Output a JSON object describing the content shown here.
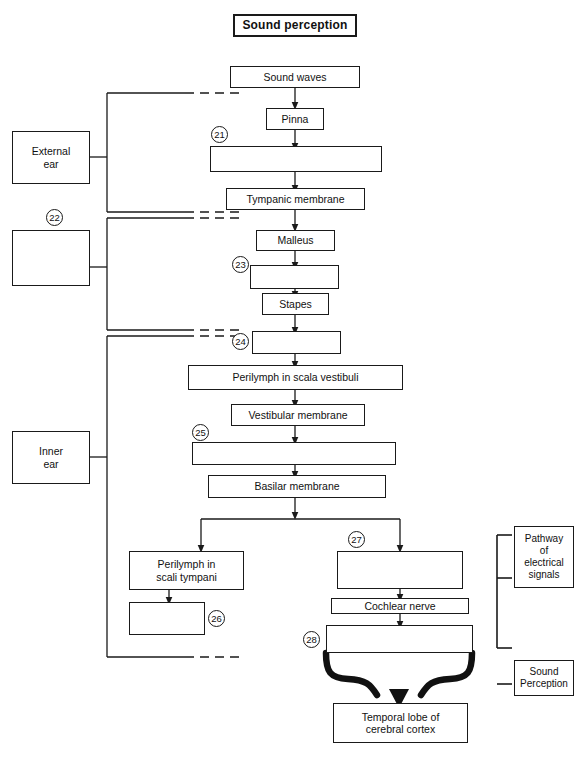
{
  "title": {
    "label": "Sound perception"
  },
  "side_labels": [
    {
      "id": "external-ear",
      "label": "External\near",
      "lines": [
        "External",
        "ear"
      ]
    },
    {
      "id": "middle-ear-blank",
      "label": "",
      "lines": []
    },
    {
      "id": "inner-ear",
      "label": "Inner\near",
      "lines": [
        "Inner",
        "ear"
      ]
    }
  ],
  "right_labels": [
    {
      "id": "pathway-of-electrical-signals",
      "lines": [
        "Pathway",
        "of",
        "electrical",
        "signals"
      ]
    },
    {
      "id": "sound-perception",
      "lines": [
        "Sound",
        "Perception"
      ]
    }
  ],
  "flow_boxes": [
    {
      "id": "sound-waves",
      "label": "Sound waves"
    },
    {
      "id": "pinna",
      "label": "Pinna"
    },
    {
      "id": "blank-21",
      "label": ""
    },
    {
      "id": "tympanic-membrane",
      "label": "Tympanic membrane"
    },
    {
      "id": "malleus",
      "label": "Malleus"
    },
    {
      "id": "blank-23",
      "label": ""
    },
    {
      "id": "stapes",
      "label": "Stapes"
    },
    {
      "id": "blank-24",
      "label": ""
    },
    {
      "id": "perilymph-scala-vestibuli",
      "label": "Perilymph in scala vestibuli"
    },
    {
      "id": "vestibular-membrane",
      "label": "Vestibular membrane"
    },
    {
      "id": "blank-25",
      "label": ""
    },
    {
      "id": "basilar-membrane",
      "label": "Basilar membrane"
    },
    {
      "id": "perilymph-scali-tympani",
      "lines": [
        "Perilymph in",
        "scali tympani"
      ]
    },
    {
      "id": "blank-26",
      "label": ""
    },
    {
      "id": "blank-27",
      "label": ""
    },
    {
      "id": "cochlear-nerve",
      "label": "Cochlear nerve"
    },
    {
      "id": "blank-28",
      "label": ""
    },
    {
      "id": "temporal-lobe",
      "lines": [
        "Temporal lobe of",
        "cerebral cortex"
      ]
    }
  ],
  "question_numbers": [
    {
      "id": "q21",
      "label": "21"
    },
    {
      "id": "q22",
      "label": "22"
    },
    {
      "id": "q23",
      "label": "23"
    },
    {
      "id": "q24",
      "label": "24"
    },
    {
      "id": "q25",
      "label": "25"
    },
    {
      "id": "q26",
      "label": "26"
    },
    {
      "id": "q27",
      "label": "27"
    },
    {
      "id": "q28",
      "label": "28"
    }
  ],
  "colors": {
    "ink": "#1a1a1a",
    "paper": "#ffffff"
  }
}
